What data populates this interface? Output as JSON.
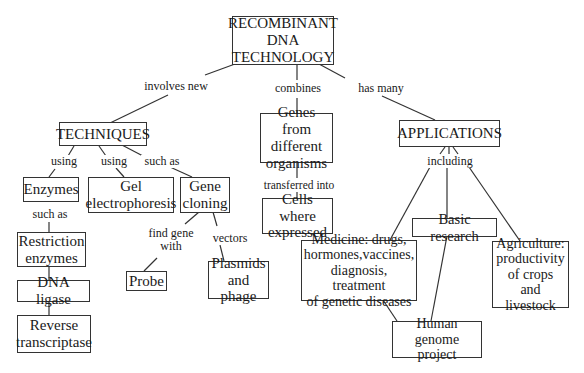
{
  "diagram": {
    "type": "concept-map",
    "root": "RECOMBINANT DNA TECHNOLOGY",
    "nodes": {
      "root": "RECOMBINANT\nDNA\nTECHNOLOGY",
      "techniques": "TECHNIQUES",
      "enzymes": "Enzymes",
      "gel": "Gel\nelectrophoresis",
      "gene_cloning": "Gene\ncloning",
      "restriction": "Restriction\nenzymes",
      "ligase": "DNA ligase",
      "reverse": "Reverse\ntranscriptase",
      "probe": "Probe",
      "plasmids": "Plasmids\nand phage",
      "genes_from": "Genes from\ndifferent\norganisms",
      "cells": "Cells where\nexpressed",
      "applications": "APPLICATIONS",
      "basic_research": "Basic research",
      "medicine": "Medicine: drugs,\nhormones,vaccines,\ndiagnosis, treatment\nof genetic diseases",
      "agriculture": "Agriculture:\nproductivity\nof crops and\nlivestock",
      "human_genome": "Human genome\nproject"
    },
    "links": {
      "involves_new": "involves new",
      "combines": "combines",
      "has_many": "has many",
      "using_1": "using",
      "using_2": "using",
      "such_as_1": "such as",
      "such_as_2": "such as",
      "find_gene_with": "find gene\nwith",
      "vectors": "vectors",
      "transferred_into": "transferred into",
      "including": "including"
    },
    "edges": [
      {
        "from": "root",
        "to": "techniques",
        "label": "involves new"
      },
      {
        "from": "root",
        "to": "genes_from",
        "label": "combines"
      },
      {
        "from": "root",
        "to": "applications",
        "label": "has many"
      },
      {
        "from": "techniques",
        "to": "enzymes",
        "label": "using"
      },
      {
        "from": "techniques",
        "to": "gel",
        "label": "using"
      },
      {
        "from": "techniques",
        "to": "gene_cloning",
        "label": "such as"
      },
      {
        "from": "enzymes",
        "to": "restriction",
        "label": "such as"
      },
      {
        "from": "restriction",
        "to": "ligase",
        "label": ""
      },
      {
        "from": "ligase",
        "to": "reverse",
        "label": ""
      },
      {
        "from": "gene_cloning",
        "to": "probe",
        "label": "find gene with"
      },
      {
        "from": "gene_cloning",
        "to": "plasmids",
        "label": "vectors"
      },
      {
        "from": "genes_from",
        "to": "cells",
        "label": "transferred into"
      },
      {
        "from": "applications",
        "to": "medicine",
        "label": "including"
      },
      {
        "from": "applications",
        "to": "basic_research",
        "label": "including"
      },
      {
        "from": "applications",
        "to": "agriculture",
        "label": "including"
      },
      {
        "from": "medicine",
        "to": "human_genome",
        "label": ""
      },
      {
        "from": "basic_research",
        "to": "human_genome",
        "label": ""
      }
    ]
  }
}
